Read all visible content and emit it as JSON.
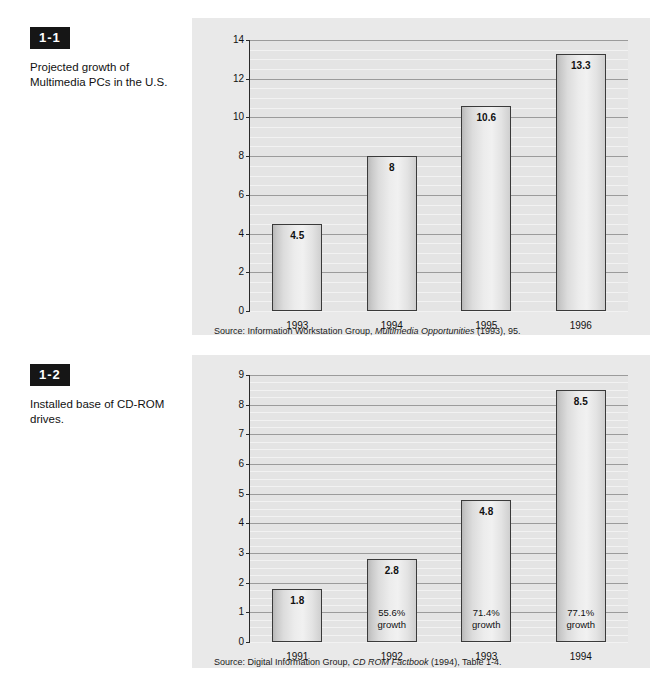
{
  "page": {
    "background": "#ffffff",
    "panel_background": "#e9e9e9",
    "plot_background": "#e4e4e4",
    "badge_color": "#161616",
    "gridline_color": "#9b9b9b",
    "axis_color": "#2a2a2a"
  },
  "figures": [
    {
      "badge": "1-1",
      "caption": "Projected growth of Multimedia PCs in the U.S.",
      "source_prefix": "Source: Information Workstation Group, ",
      "source_italic": "Multimedia Opportunities",
      "source_suffix": " (1993), 95."
    },
    {
      "badge": "1-2",
      "caption": "Installed base of CD-ROM drives.",
      "source_prefix": "Source: Digital Information Group, ",
      "source_italic": "CD ROM Factbook",
      "source_suffix": " (1994), Table 1-4."
    }
  ],
  "chart_data": [
    {
      "type": "bar",
      "title": "Projected growth of Multimedia PCs in the U.S.",
      "xlabel": "",
      "ylabel": "Multimedia PCs in millions",
      "categories": [
        "1993",
        "1994",
        "1995",
        "1996"
      ],
      "values": [
        4.5,
        8,
        10.6,
        13.3
      ],
      "value_labels": [
        "4.5",
        "8",
        "10.6",
        "13.3"
      ],
      "ylim": [
        0,
        14
      ],
      "yticks": [
        0,
        2,
        4,
        6,
        8,
        10,
        12,
        14
      ],
      "ytick_labels": [
        "0",
        "2",
        "4",
        "6",
        "8",
        "10",
        "12",
        "14"
      ],
      "minor_tick_step": 0.5,
      "grid": true,
      "legend": "none",
      "source": "Source: Information Workstation Group, Multimedia Opportunities (1993), 95."
    },
    {
      "type": "bar",
      "title": "Installed base of CD-ROM drives.",
      "xlabel": "",
      "ylabel": "Installed base of CD-ROM drives in millions",
      "categories": [
        "1991",
        "1992",
        "1993",
        "1994"
      ],
      "values": [
        1.8,
        2.8,
        4.8,
        8.5
      ],
      "value_labels": [
        "1.8",
        "2.8",
        "4.8",
        "8.5"
      ],
      "growth_labels": [
        "",
        "55.6%\ngrowth",
        "71.4%\ngrowth",
        "77.1%\ngrowth"
      ],
      "growth_line1": [
        "",
        "55.6%",
        "71.4%",
        "77.1%"
      ],
      "growth_line2": [
        "",
        "growth",
        "growth",
        "growth"
      ],
      "ylim": [
        0,
        9
      ],
      "yticks": [
        0,
        1,
        2,
        3,
        4,
        5,
        6,
        7,
        8,
        9
      ],
      "ytick_labels": [
        "0",
        "1",
        "2",
        "3",
        "4",
        "5",
        "6",
        "7",
        "8",
        "9"
      ],
      "minor_tick_step": 0.25,
      "grid": true,
      "legend": "none",
      "source": "Source: Digital Information Group, CD ROM Factbook (1994), Table 1-4."
    }
  ]
}
